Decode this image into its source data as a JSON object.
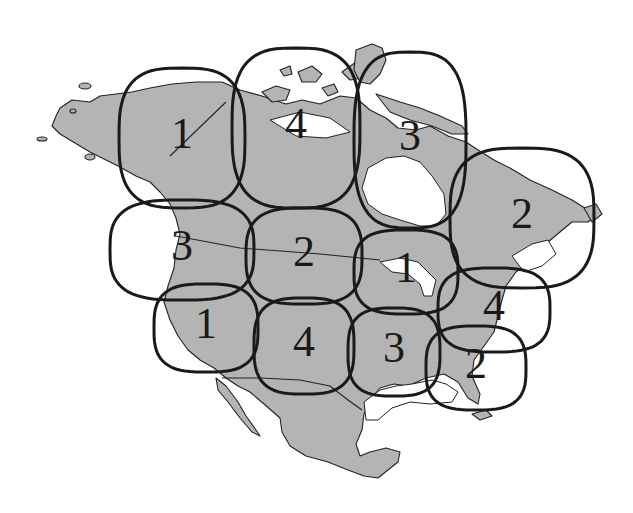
{
  "diagram": {
    "colors": {
      "land": "#b4b4b4",
      "outline": "#1a1a1a",
      "background": "#ffffff"
    },
    "regions": [
      {
        "id": "alaska",
        "label": "1",
        "cx": 182,
        "cy": 138,
        "rx": 63,
        "ry": 70
      },
      {
        "id": "nunavut-west",
        "label": "4",
        "cx": 296,
        "cy": 128,
        "rx": 64,
        "ry": 80
      },
      {
        "id": "arctic-east-quebec",
        "label": "3",
        "cx": 410,
        "cy": 140,
        "rx": 56,
        "ry": 88
      },
      {
        "id": "labrador-maritimes",
        "label": "2",
        "cx": 522,
        "cy": 218,
        "rx": 72,
        "ry": 70
      },
      {
        "id": "pacific-northwest",
        "label": "3",
        "cx": 182,
        "cy": 250,
        "rx": 72,
        "ry": 50
      },
      {
        "id": "prairies-plains",
        "label": "2",
        "cx": 304,
        "cy": 256,
        "rx": 58,
        "ry": 48
      },
      {
        "id": "great-lakes",
        "label": "1",
        "cx": 406,
        "cy": 272,
        "rx": 52,
        "ry": 42
      },
      {
        "id": "northeast",
        "label": "4",
        "cx": 494,
        "cy": 310,
        "rx": 56,
        "ry": 42
      },
      {
        "id": "california-southwest",
        "label": "1",
        "cx": 206,
        "cy": 328,
        "rx": 52,
        "ry": 44
      },
      {
        "id": "texas-southwest",
        "label": "4",
        "cx": 304,
        "cy": 346,
        "rx": 50,
        "ry": 48
      },
      {
        "id": "south-central",
        "label": "3",
        "cx": 394,
        "cy": 352,
        "rx": 46,
        "ry": 44
      },
      {
        "id": "southeast-florida",
        "label": "2",
        "cx": 476,
        "cy": 368,
        "rx": 50,
        "ry": 42
      }
    ]
  }
}
